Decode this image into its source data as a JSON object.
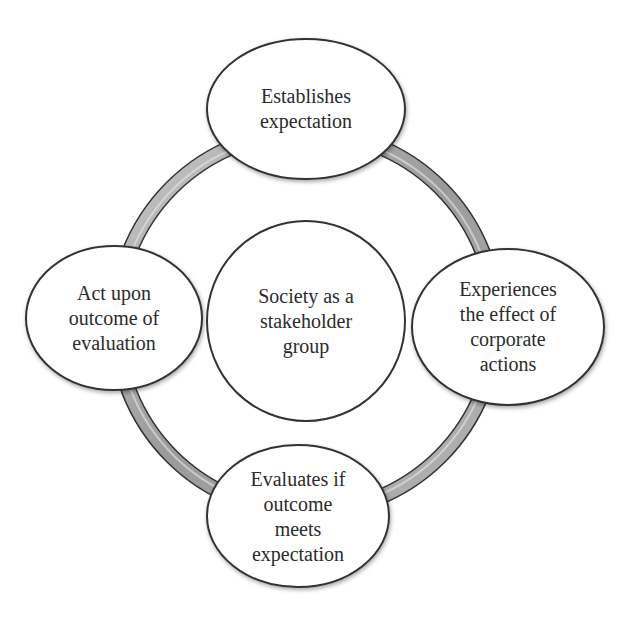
{
  "diagram": {
    "type": "cycle",
    "center": {
      "label": "Society as a\nstakeholder\ngroup"
    },
    "nodes": [
      {
        "id": "top",
        "label": "Establishes\nexpectation"
      },
      {
        "id": "right",
        "label": "Experiences\nthe effect of\ncorporate\nactions"
      },
      {
        "id": "bottom",
        "label": "Evaluates if\noutcome\nmeets\nexpectation"
      },
      {
        "id": "left",
        "label": "Act upon\noutcome of\nevaluation"
      }
    ],
    "colors": {
      "ring_fill": "#a6a6a6",
      "ring_highlight": "#e6e6e6",
      "outline": "#333333",
      "node_fill": "#ffffff",
      "text": "#2b2b2b"
    }
  }
}
